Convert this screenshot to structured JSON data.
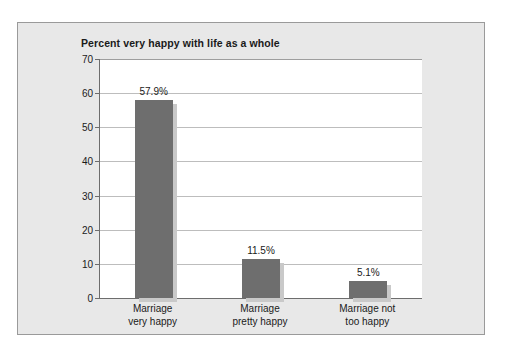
{
  "chart_data": {
    "type": "bar",
    "title": "Percent very happy with life as a whole",
    "xlabel": "",
    "ylabel": "",
    "ylim": [
      0,
      70
    ],
    "yticks": [
      0,
      10,
      20,
      30,
      40,
      50,
      60,
      70
    ],
    "grid": true,
    "legend": false,
    "categories": [
      "Marriage very happy",
      "Marriage pretty happy",
      "Marriage not too happy"
    ],
    "category_lines": [
      [
        "Marriage",
        "very happy"
      ],
      [
        "Marriage",
        "pretty happy"
      ],
      [
        "Marriage not",
        "too happy"
      ]
    ],
    "values": [
      57.9,
      11.5,
      5.1
    ],
    "data_labels": [
      "57.9%",
      "11.5%",
      "5.1%"
    ],
    "bar_color": "#6e6e6e",
    "bar_shadow_color": "#c9c9c9",
    "plot_background": "#ffffff",
    "figure_background": "#e8e8e8",
    "gridline_color": "#bdbdbd",
    "axis_color": "#6d6d6d",
    "text_color": "#1a1a1a"
  }
}
